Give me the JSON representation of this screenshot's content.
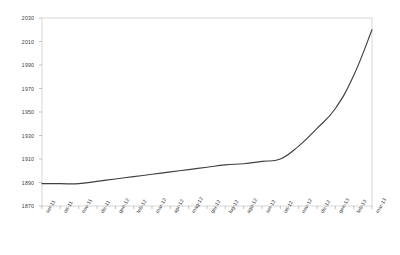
{
  "chart_data": {
    "type": "line",
    "title": "",
    "subtitle": "",
    "xlabel": "",
    "ylabel": "",
    "legend": [],
    "legend_position": "none",
    "grid": false,
    "ylim": [
      1870,
      2030
    ],
    "ytick_step": 20,
    "yticks": [
      1870,
      1890,
      1910,
      1930,
      1950,
      1970,
      1990,
      2010,
      2030
    ],
    "ytick_labels": [
      "1870",
      "1890",
      "1910",
      "1930",
      "1950",
      "1970",
      "1990",
      "2010",
      "2030"
    ],
    "categories": [
      "set-11",
      "ott-11",
      "nov-11",
      "dic-11",
      "gen-12",
      "feb-12",
      "mar-12",
      "apr-12",
      "mag-12",
      "giu-12",
      "lug-12",
      "ago-12",
      "set-12",
      "ott-12",
      "nov-12",
      "dic-12",
      "gen-13",
      "feb-13",
      "mar-13"
    ],
    "series": [
      {
        "name": "",
        "color": "#404040",
        "values": [
          1889,
          1889,
          1889,
          1891,
          1893,
          1895,
          1897,
          1899,
          1901,
          1903,
          1905,
          1906,
          1908,
          1910,
          1921,
          1936,
          1953,
          1981,
          2020
        ]
      }
    ],
    "annotations": []
  },
  "axis_style": {
    "axis_color": "#9a9a9a",
    "tick_color": "#9a9a9a",
    "label_color": "#3a3a3a",
    "plot_background": "#ffffff",
    "line_color": "#404040"
  }
}
